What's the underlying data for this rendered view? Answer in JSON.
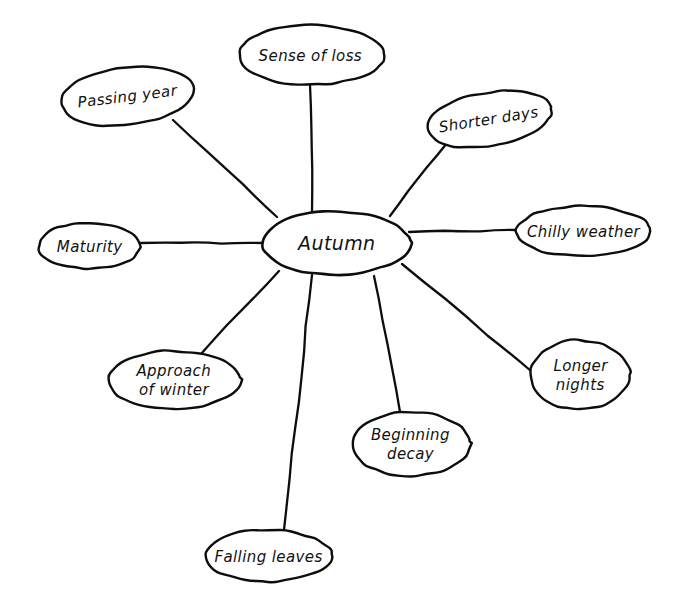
{
  "diagram": {
    "type": "mind-map",
    "title_visible": false,
    "background_color": "#ffffff",
    "ink_color": "#0d0d0d",
    "style": "hand-drawn",
    "canvas": {
      "width": 680,
      "height": 609
    },
    "center": {
      "id": "autumn",
      "label": "Autumn",
      "cx": 336,
      "cy": 243,
      "rx": 74,
      "ry": 32,
      "rotate": 0,
      "font_size": 19,
      "lines": [
        "Autumn"
      ]
    },
    "branches": [
      {
        "id": "sense-of-loss",
        "label": "Sense of loss",
        "lines": [
          "Sense of loss"
        ],
        "cx": 311,
        "cy": 55,
        "rx": 73,
        "ry": 30,
        "rotate": 0,
        "font_size": 15,
        "connector": {
          "x1": 310,
          "y1": 85,
          "x2": 312,
          "y2": 212
        }
      },
      {
        "id": "passing-year",
        "label": "Passing year",
        "lines": [
          "Passing year"
        ],
        "cx": 127,
        "cy": 96,
        "rx": 67,
        "ry": 29,
        "rotate": -7,
        "font_size": 15,
        "connector": {
          "x1": 173,
          "y1": 120,
          "x2": 277,
          "y2": 217
        }
      },
      {
        "id": "shorter-days",
        "label": "Shorter days",
        "lines": [
          "Shorter days"
        ],
        "cx": 489,
        "cy": 119,
        "rx": 63,
        "ry": 27,
        "rotate": -9,
        "font_size": 15,
        "connector": {
          "x1": 447,
          "y1": 143,
          "x2": 390,
          "y2": 216
        }
      },
      {
        "id": "chilly-weather",
        "label": "Chilly weather",
        "lines": [
          "Chilly weather"
        ],
        "cx": 583,
        "cy": 231,
        "rx": 67,
        "ry": 25,
        "rotate": 0,
        "font_size": 15,
        "connector": {
          "x1": 516,
          "y1": 230,
          "x2": 409,
          "y2": 232
        }
      },
      {
        "id": "longer-nights",
        "label": "Longer nights",
        "lines": [
          "Longer",
          "nights"
        ],
        "cx": 580,
        "cy": 375,
        "rx": 50,
        "ry": 35,
        "rotate": 0,
        "font_size": 15,
        "connector": {
          "x1": 531,
          "y1": 371,
          "x2": 402,
          "y2": 264
        }
      },
      {
        "id": "beginning-decay",
        "label": "Beginning decay",
        "lines": [
          "Beginning",
          "decay"
        ],
        "cx": 411,
        "cy": 444,
        "rx": 59,
        "ry": 32,
        "rotate": 0,
        "font_size": 15,
        "connector": {
          "x1": 400,
          "y1": 412,
          "x2": 374,
          "y2": 276
        }
      },
      {
        "id": "falling-leaves",
        "label": "Falling leaves",
        "lines": [
          "Falling leaves"
        ],
        "cx": 268,
        "cy": 556,
        "rx": 64,
        "ry": 26,
        "rotate": 0,
        "font_size": 15,
        "connector": {
          "x1": 284,
          "y1": 530,
          "x2": 312,
          "y2": 275
        }
      },
      {
        "id": "approach-of-winter",
        "label": "Approach of winter",
        "lines": [
          "Approach",
          "of winter"
        ],
        "cx": 174,
        "cy": 380,
        "rx": 66,
        "ry": 29,
        "rotate": 0,
        "font_size": 15,
        "connector": {
          "x1": 201,
          "y1": 354,
          "x2": 279,
          "y2": 271
        }
      },
      {
        "id": "maturity",
        "label": "Maturity",
        "lines": [
          "Maturity"
        ],
        "cx": 89,
        "cy": 246,
        "rx": 51,
        "ry": 23,
        "rotate": 0,
        "font_size": 15,
        "connector": {
          "x1": 140,
          "y1": 243,
          "x2": 262,
          "y2": 243
        }
      }
    ]
  }
}
